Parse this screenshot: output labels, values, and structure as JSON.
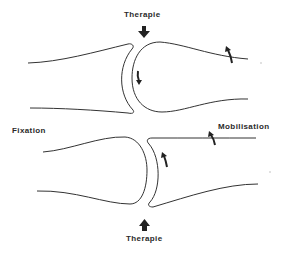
{
  "labels": {
    "therapy_top": "Therapie",
    "therapy_bottom": "Therapie",
    "fixation": "Fixation",
    "mobilisation": "Mobilisation"
  },
  "colors": {
    "stroke": "#333333",
    "text": "#2a2a2a",
    "background": "#ffffff"
  },
  "diagram": {
    "joints": [
      {
        "name": "upper-joint",
        "concave_side": "left",
        "convex_side": "right",
        "therapy_arrow": "down",
        "glide_arrow": "down",
        "roll_arrow": "up"
      },
      {
        "name": "lower-joint",
        "concave_side": "right",
        "convex_side": "left",
        "therapy_arrow": "up",
        "glide_arrow": "up",
        "roll_arrow": "up"
      }
    ]
  }
}
